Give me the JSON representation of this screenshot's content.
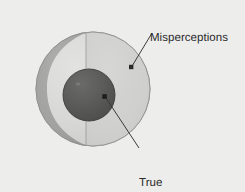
{
  "figure": {
    "type": "concentric-sphere-diagram",
    "background_color": "#ededec",
    "labels": {
      "outer": "Misperceptions",
      "inner_line1": "True",
      "inner_line2": "incompatibility"
    },
    "label_text_color": "#2b2b2b",
    "regions": [
      {
        "name": "outer-sphere",
        "semantic": "Misperceptions",
        "fill_light": "#d6d6d4",
        "fill_right_half": "#cfcfcd",
        "fill_crescent": "#a2a2a0",
        "edge_color": "#8e8e8c",
        "center_x": 93,
        "center_y": 89,
        "radius": 57
      },
      {
        "name": "inner-sphere",
        "semantic": "True incompatibility",
        "fill": "#585856",
        "edge_color": "#3d3d3b",
        "center_x": 89,
        "center_y": 95,
        "radius": 26
      }
    ],
    "leaders": [
      {
        "name": "misperceptions-leader",
        "from_x": 152,
        "from_y": 33,
        "to_x": 131,
        "to_y": 67,
        "dot_x": 131,
        "dot_y": 67,
        "color": "#3a3a38"
      },
      {
        "name": "true-incompatibility-leader",
        "from_x": 139,
        "from_y": 148,
        "to_x": 104,
        "to_y": 96,
        "dot_x": 104,
        "dot_y": 96,
        "color": "#3a3a38"
      }
    ]
  }
}
